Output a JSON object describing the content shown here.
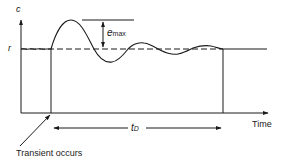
{
  "diagram": {
    "type": "transient-response",
    "axes": {
      "y_label": "c",
      "x_label": "Time"
    },
    "reference_label": "r",
    "overshoot": {
      "symbol": "e",
      "subscript": "max"
    },
    "duration": {
      "symbol": "t",
      "subscript": "D"
    },
    "annotation": "Transient occurs",
    "colors": {
      "line": "#1a1a1a",
      "background": "#ffffff"
    }
  }
}
